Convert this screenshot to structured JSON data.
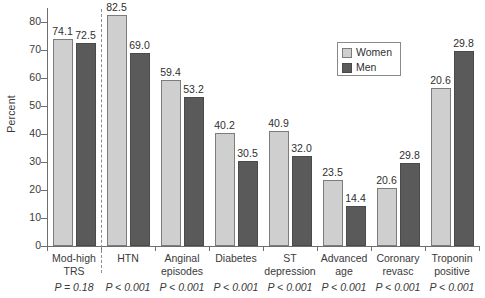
{
  "chart_data": {
    "type": "bar",
    "title": "",
    "xlabel": "",
    "ylabel": "Percent",
    "ylim": [
      0,
      85
    ],
    "yticks": [
      0,
      10,
      20,
      30,
      40,
      50,
      60,
      70,
      80
    ],
    "grid": false,
    "legend_position": "top-right",
    "categories": [
      "Mod-high\nTRS",
      "HTN",
      "Anginal\nepisodes",
      "Diabetes",
      "ST\ndepression",
      "Advanced\nage",
      "Coronary\nrevasc",
      "Troponin\npositive"
    ],
    "series": [
      {
        "name": "Women",
        "color": "#cfcfcf",
        "values": [
          74.1,
          82.5,
          59.4,
          40.2,
          40.9,
          23.5,
          20.6,
          56.5
        ],
        "labels": [
          "74.1",
          "82.5",
          "59.4",
          "40.2",
          "40.9",
          "23.5",
          "20.6",
          "20.6"
        ]
      },
      {
        "name": "Men",
        "color": "#5a5a5a",
        "values": [
          72.5,
          69.0,
          53.2,
          30.5,
          32.0,
          14.4,
          29.8,
          69.5
        ],
        "labels": [
          "72.5",
          "69.0",
          "53.2",
          "30.5",
          "32.0",
          "14.4",
          "29.8",
          "29.8"
        ]
      }
    ],
    "annotations": {
      "p_values": [
        "P = 0.18",
        "P < 0.001",
        "P < 0.001",
        "P < 0.001",
        "P < 0.001",
        "P < 0.001",
        "P < 0.001",
        "P < 0.001"
      ],
      "divider_after_category": 0,
      "divider_style": "dashed"
    }
  },
  "legend": {
    "items": [
      {
        "label": "Women",
        "swatch": "women-swatch"
      },
      {
        "label": "Men",
        "swatch": "men-swatch"
      }
    ]
  }
}
